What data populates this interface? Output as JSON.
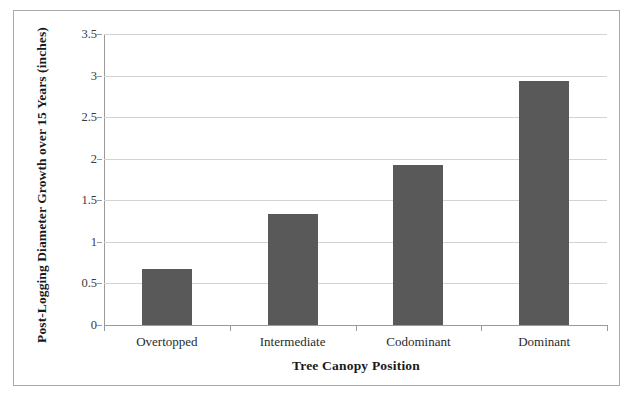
{
  "chart_data": {
    "type": "bar",
    "title": "",
    "categories": [
      "Overtopped",
      "Intermediate",
      "Codominant",
      "Dominant"
    ],
    "values": [
      0.67,
      1.33,
      1.93,
      2.93
    ],
    "series": [
      {
        "name": "Post-Logging Diameter Growth over 15 Years (inches)",
        "values": [
          0.67,
          1.33,
          1.93,
          2.93
        ]
      }
    ],
    "xlabel": "Tree Canopy Position",
    "ylabel": "Post-Logging Diameter Growth over 15 Years (inches)",
    "ylim": [
      0,
      3.5
    ],
    "y_ticks": [
      "0",
      "0.5",
      "1",
      "1.5",
      "2",
      "2.5",
      "3",
      "3.5"
    ],
    "y_tick_values": [
      0,
      0.5,
      1,
      1.5,
      2,
      2.5,
      3,
      3.5
    ],
    "grid": "horizontal",
    "legend": "none",
    "bar_color": "#595959",
    "gridline_color": "#d3d3d3",
    "axis_color": "#9a9a9a",
    "frame_color": "#aaaaaa",
    "background_color": "#ffffff"
  }
}
